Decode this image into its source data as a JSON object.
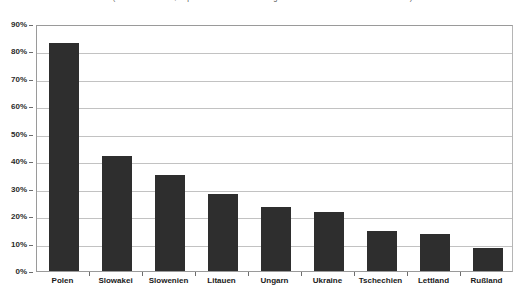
{
  "chart_data": {
    "type": "bar",
    "title": "",
    "subtitle": "(Stand: März 1999, Exportanteile in Prozent der gesamten Ausfuhren in die Beitrittsländer)",
    "xlabel": "",
    "ylabel": "",
    "categories": [
      "Polen",
      "Slowakei",
      "Slowenien",
      "Litauen",
      "Ungarn",
      "Ukraine",
      "Tschechien",
      "Lettland",
      "Rußland"
    ],
    "values": [
      83,
      42,
      35,
      28,
      23.5,
      21.5,
      14.5,
      13.5,
      8.5
    ],
    "ylim": [
      0,
      90
    ],
    "ytick_values": [
      0,
      10,
      20,
      30,
      40,
      50,
      60,
      70,
      80,
      90
    ],
    "ytick_labels": [
      "0%",
      "10%",
      "20%",
      "30%",
      "40%",
      "50%",
      "60%",
      "70%",
      "80%",
      "90%"
    ],
    "grid": true,
    "legend": false,
    "bar_color": "#2e2e2e",
    "gridline_color": "#c2c2c2",
    "axis_color": "#6d6d6d",
    "background": "#ffffff"
  }
}
